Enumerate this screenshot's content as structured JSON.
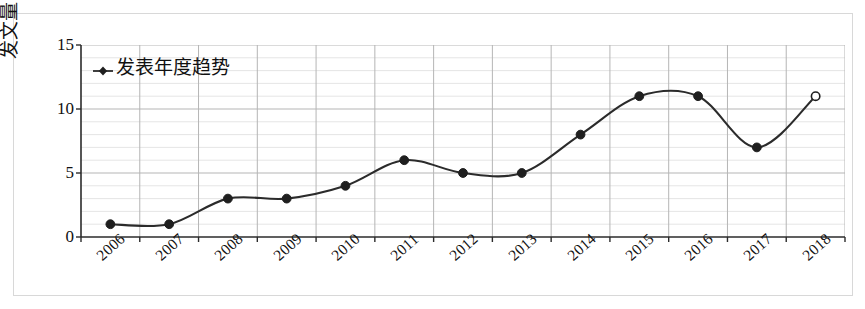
{
  "chart_data": {
    "type": "line",
    "title": "",
    "xlabel": "",
    "ylabel": "发文量（篇）",
    "categories": [
      "2006",
      "2007",
      "2008",
      "2009",
      "2010",
      "2011",
      "2012",
      "2013",
      "2014",
      "2015",
      "2016",
      "2017",
      "2018"
    ],
    "series": [
      {
        "name": "发表年度趋势",
        "values": [
          1,
          1,
          3,
          3,
          4,
          6,
          5,
          5,
          8,
          11,
          11,
          7,
          11
        ],
        "marker": "circle",
        "open_markers": [
          2018
        ],
        "color": "#2b2b2b",
        "smooth": true
      }
    ],
    "ylim": [
      0,
      15
    ],
    "yticks": [
      0,
      5,
      10,
      15
    ],
    "ytick_labels": [
      "0",
      "5",
      "10",
      "15"
    ],
    "y_minor_step": 1,
    "grid": {
      "major_y": true,
      "minor_y": true,
      "major_x": true
    },
    "legend": {
      "position": "top-left",
      "entries": [
        "发表年度趋势"
      ]
    },
    "xtick_rotation": -42
  },
  "axes": {
    "y_title": "发文量（篇）",
    "y_labels": [
      "15",
      "10",
      "5",
      "0"
    ],
    "x_labels": [
      "2006",
      "2007",
      "2008",
      "2009",
      "2010",
      "2011",
      "2012",
      "2013",
      "2014",
      "2015",
      "2016",
      "2017",
      "2018"
    ]
  },
  "legend": {
    "series_label": "发表年度趋势",
    "marker_shape": "diamond-marker"
  },
  "colors": {
    "line": "#2b2b2b",
    "marker": "#1f1f1f",
    "major_grid": "#b5b5b5",
    "minor_grid": "#e2e2e2",
    "axis": "#2b2b2b",
    "frame": "#d8d8d8",
    "background": "#ffffff"
  }
}
